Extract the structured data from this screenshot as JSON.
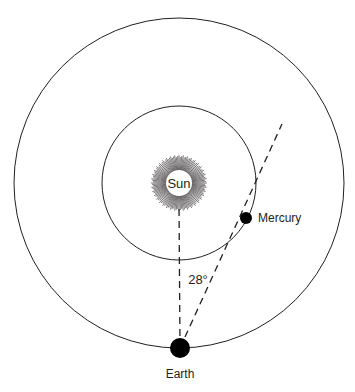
{
  "diagram": {
    "labels": {
      "sun": "Sun",
      "mercury": "Mercury",
      "earth": "Earth",
      "angle": "28°"
    },
    "sun": {
      "cx": 179,
      "cy": 183,
      "ray_radius": 28,
      "disk_radius": 13,
      "rays": 120
    },
    "orbits": [
      {
        "name": "mercury-orbit",
        "cx": 179,
        "cy": 183,
        "r": 77
      },
      {
        "name": "earth-orbit",
        "cx": 179,
        "cy": 183,
        "r": 165
      }
    ],
    "mercury": {
      "cx": 246,
      "cy": 218,
      "r": 6
    },
    "earth": {
      "cx": 180,
      "cy": 348,
      "r": 10
    },
    "sightlines": [
      {
        "name": "earth-sun-line",
        "x1": 180,
        "y1": 348,
        "x2": 179,
        "y2": 205
      },
      {
        "name": "earth-mercury-line",
        "x1": 180,
        "y1": 348,
        "x2": 282,
        "y2": 124
      }
    ],
    "colors": {
      "stroke": "#231f20",
      "background": "#ffffff"
    }
  }
}
